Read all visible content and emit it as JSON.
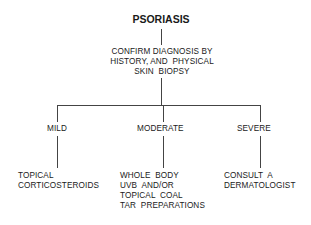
{
  "diagram": {
    "root": "PSORIASIS",
    "step": [
      "CONFIRM DIAGNOSIS BY",
      "HISTORY, AND  PHYSICAL",
      "SKIN  BIOPSY"
    ],
    "branches": [
      {
        "label": "MILD",
        "treatment": [
          "TOPICAL",
          "CORTICOSTEROIDS"
        ]
      },
      {
        "label": "MODERATE",
        "treatment": [
          "WHOLE  BODY",
          "UVB  AND/OR",
          "TOPICAL  COAL",
          "TAR  PREPARATIONS"
        ]
      },
      {
        "label": "SEVERE",
        "treatment": [
          "CONSULT  A",
          "DERMATOLOGIST"
        ]
      }
    ]
  }
}
